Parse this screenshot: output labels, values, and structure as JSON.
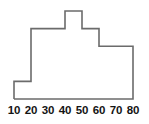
{
  "chart_data": {
    "type": "bar",
    "title": "",
    "subtitle": "",
    "xlabel": "",
    "ylabel": "",
    "grid": false,
    "legend": null,
    "style": "step-outline-histogram",
    "xlim": [
      10,
      80
    ],
    "ylim": [
      0,
      5
    ],
    "bin_width": 10,
    "bin_edges": [
      10,
      20,
      30,
      40,
      50,
      60,
      70,
      80
    ],
    "xtick_labels": [
      "10",
      "20",
      "30",
      "40",
      "50",
      "60",
      "70",
      "80"
    ],
    "xticks": [
      10,
      20,
      30,
      40,
      50,
      60,
      70,
      80
    ],
    "categories": [
      "10-20",
      "20-30",
      "30-40",
      "40-50",
      "50-60",
      "60-70",
      "70-80"
    ],
    "values": [
      1,
      4,
      4,
      5,
      4,
      3,
      3
    ],
    "bars": [
      {
        "bin": "10-20",
        "x0": 10,
        "x1": 20,
        "value": 1
      },
      {
        "bin": "20-30",
        "x0": 20,
        "x1": 30,
        "value": 4
      },
      {
        "bin": "30-40",
        "x0": 30,
        "x1": 40,
        "value": 4
      },
      {
        "bin": "40-50",
        "x0": 40,
        "x1": 50,
        "value": 5
      },
      {
        "bin": "50-60",
        "x0": 50,
        "x1": 60,
        "value": 4
      },
      {
        "bin": "60-70",
        "x0": 60,
        "x1": 70,
        "value": 3
      },
      {
        "bin": "70-80",
        "x0": 70,
        "x1": 80,
        "value": 3
      }
    ],
    "colors": {
      "outline": "#6b6b6b",
      "fill": "#ffffff",
      "background": "#ffffff",
      "tick_text": "#141414"
    }
  },
  "axis": {
    "ticks": [
      {
        "label": "10",
        "left": 14
      },
      {
        "label": "20",
        "left": 31
      },
      {
        "label": "30",
        "left": 48
      },
      {
        "label": "40",
        "left": 65
      },
      {
        "label": "50",
        "left": 82
      },
      {
        "label": "60",
        "left": 99
      },
      {
        "label": "70",
        "left": 116
      },
      {
        "label": "80",
        "left": 133
      }
    ]
  }
}
